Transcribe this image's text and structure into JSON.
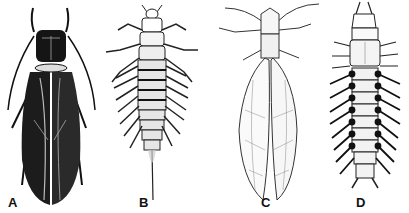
{
  "figure": {
    "panels": [
      {
        "label": "A",
        "subject": "winged adult insect, dark (alderfly-like)",
        "color": "#1a1a1a"
      },
      {
        "label": "B",
        "subject": "aquatic larva with lateral filaments and single terminal filament",
        "color": "#333333"
      },
      {
        "label": "C",
        "subject": "winged adult insect, pale wings with long antennae (dobsonfly-like)",
        "color": "#444444"
      },
      {
        "label": "D",
        "subject": "aquatic larva with lateral gill filaments and terminal prolegs (hellgrammite-like)",
        "color": "#222222"
      }
    ]
  }
}
